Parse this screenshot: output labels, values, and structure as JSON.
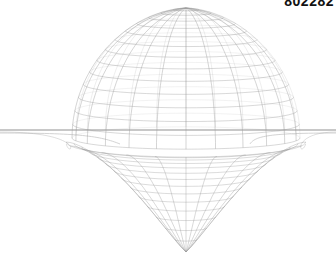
{
  "image": {
    "corner_label": "802282",
    "subject": "wireframe sphere above a funnel-shaped gravity well on a flat plane",
    "colors": {
      "background": "#ffffff",
      "wire": "#9a9a9a",
      "plane": "#c8c8c8",
      "label": "#111111"
    },
    "geometry": {
      "center_x": 186,
      "plane_y": 130,
      "sphere_radius_x": 114,
      "sphere_top_y": 8,
      "funnel_bottom_y": 252,
      "meridians": 24,
      "parallels": 14
    }
  }
}
